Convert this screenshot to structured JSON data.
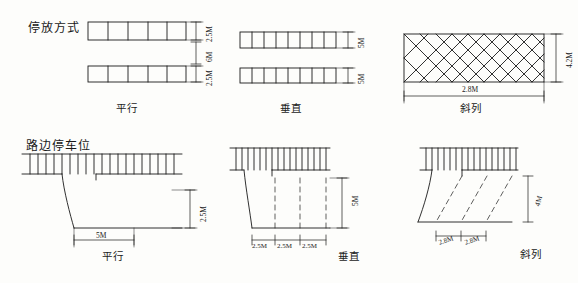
{
  "sheet": {
    "titles": [
      {
        "id": "parking-mode-title",
        "text": "停放方式"
      },
      {
        "id": "roadside-parking-title",
        "text": "路边停车位"
      }
    ],
    "captions": [
      {
        "id": "caption-row1-parallel",
        "text": "平行"
      },
      {
        "id": "caption-row1-perpendicular",
        "text": "垂直"
      },
      {
        "id": "caption-row1-angled",
        "text": "斜列"
      },
      {
        "id": "caption-row2-parallel",
        "text": "平行"
      },
      {
        "id": "caption-row2-perpendicular",
        "text": "垂直"
      },
      {
        "id": "caption-row2-angled",
        "text": "斜列"
      }
    ],
    "dimensions": [
      {
        "id": "dim-r1a-top",
        "text": "2.5M"
      },
      {
        "id": "dim-r1a-mid",
        "text": "6M"
      },
      {
        "id": "dim-r1a-bottom",
        "text": "2.5M"
      },
      {
        "id": "dim-r1b-top",
        "text": "5M"
      },
      {
        "id": "dim-r1b-bottom",
        "text": "5M"
      },
      {
        "id": "dim-r1c-side",
        "text": "4.2M"
      },
      {
        "id": "dim-r1c-bottom",
        "text": "2.8M"
      },
      {
        "id": "dim-r2a-right",
        "text": "2.5M"
      },
      {
        "id": "dim-r2a-bottom",
        "text": "5M"
      },
      {
        "id": "dim-r2b-right",
        "text": "5M"
      },
      {
        "id": "dim-r2b-b1",
        "text": "2.5M"
      },
      {
        "id": "dim-r2b-b2",
        "text": "2.5M"
      },
      {
        "id": "dim-r2b-b3",
        "text": "2.5M"
      },
      {
        "id": "dim-r2c-right",
        "text": "4M"
      },
      {
        "id": "dim-r2c-b1",
        "text": "2.8M"
      },
      {
        "id": "dim-r2c-b2",
        "text": "2.8M"
      }
    ],
    "colors": {
      "ink": "#1a1a1a",
      "paper": "#fdfdfb"
    }
  }
}
